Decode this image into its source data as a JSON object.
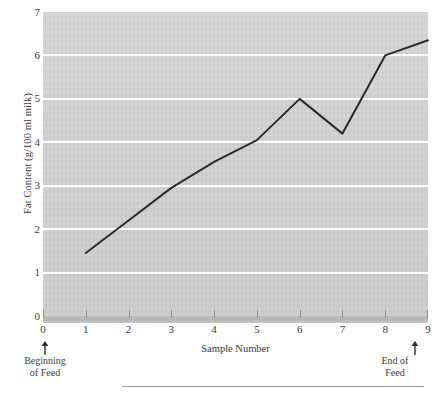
{
  "chart_data": {
    "type": "line",
    "title": "",
    "xlabel": "Sample Number",
    "ylabel": "Fat Content (g/100 ml milk)",
    "x": [
      1,
      2,
      3,
      4,
      5,
      6,
      7,
      8,
      9
    ],
    "values": [
      1.45,
      2.2,
      2.95,
      3.55,
      4.05,
      5.0,
      4.2,
      6.0,
      6.35
    ],
    "series": [
      {
        "name": "Fat Content",
        "values": [
          1.45,
          2.2,
          2.95,
          3.55,
          4.05,
          5.0,
          4.2,
          6.0,
          6.35
        ]
      }
    ],
    "xlim": [
      0,
      9
    ],
    "ylim": [
      0,
      7
    ],
    "xticks": [
      "0",
      "1",
      "2",
      "3",
      "4",
      "5",
      "6",
      "7",
      "8",
      "9"
    ],
    "yticks": [
      "0",
      "1",
      "2",
      "3",
      "4",
      "5",
      "6",
      "7"
    ],
    "grid": "horizontal",
    "legend": "none",
    "annotations": [
      {
        "text": "Beginning\nof Feed",
        "line1": "Beginning",
        "line2": "of Feed",
        "x": 0,
        "marker": "up-arrow"
      },
      {
        "text": "End of\nFeed",
        "line1": "End of",
        "line2": "Feed",
        "x": 9,
        "marker": "up-arrow"
      }
    ],
    "colors": {
      "panel_background": "#cfcfcf",
      "gridline": "#ffffff",
      "series_line": "#2b2b2b",
      "text": "#3a3a3a",
      "axis_shadow": "#b5b5b5",
      "bottom_rule": "#9a9a9a"
    }
  },
  "axes": {
    "y_title": "Fat Content (g/100 ml milk)",
    "x_title": "Sample Number",
    "y_tick_labels": [
      "7",
      "6",
      "5",
      "4",
      "3",
      "2",
      "1",
      "0"
    ],
    "x_tick_labels": [
      "0",
      "1",
      "2",
      "3",
      "4",
      "5",
      "6",
      "7",
      "8",
      "9"
    ]
  },
  "annotations": {
    "beginning": {
      "line1": "Beginning",
      "line2": "of Feed"
    },
    "end": {
      "line1": "End of",
      "line2": "Feed"
    }
  }
}
